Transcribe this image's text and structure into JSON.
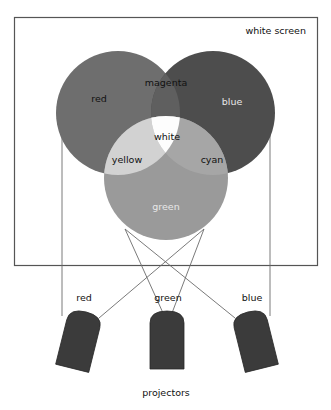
{
  "figure": {
    "title_label": "white screen",
    "footer_label": "projectors",
    "screen": {
      "label": "white screen",
      "border_color": "#555555"
    },
    "circles": [
      {
        "name": "red",
        "label": "red",
        "color": "#6e6e6e",
        "cx": 118,
        "cy": 113,
        "r": 62
      },
      {
        "name": "blue",
        "label": "blue",
        "color": "#4d4d4d",
        "cx": 213,
        "cy": 113,
        "r": 62
      },
      {
        "name": "green",
        "label": "green",
        "color": "#9a9a9a",
        "cx": 166,
        "cy": 178,
        "r": 62
      }
    ],
    "overlaps": [
      {
        "name": "magenta",
        "label": "magenta",
        "color": "#5f5f5f"
      },
      {
        "name": "yellow",
        "label": "yellow",
        "color": "#d2d2d2"
      },
      {
        "name": "cyan",
        "label": "cyan",
        "color": "#a6a6a6"
      },
      {
        "name": "white",
        "label": "white",
        "color": "#fdfdfd"
      }
    ],
    "region_labels": [
      {
        "key": "red",
        "text": "red",
        "x": 99,
        "y": 99,
        "tone": "dark"
      },
      {
        "key": "magenta",
        "text": "magenta",
        "x": 166,
        "y": 83,
        "tone": "dark"
      },
      {
        "key": "blue",
        "text": "blue",
        "x": 232,
        "y": 102,
        "tone": "light"
      },
      {
        "key": "white",
        "text": "white",
        "x": 167,
        "y": 137,
        "tone": "dark"
      },
      {
        "key": "yellow",
        "text": "yellow",
        "x": 127,
        "y": 160,
        "tone": "dark"
      },
      {
        "key": "cyan",
        "text": "cyan",
        "x": 212,
        "y": 160,
        "tone": "dark"
      },
      {
        "key": "green",
        "text": "green",
        "x": 166,
        "y": 207,
        "tone": "light"
      }
    ],
    "projectors": [
      {
        "name": "red",
        "label": "red",
        "label_x": 84,
        "label_y": 298,
        "color": "#3b3b3b",
        "tilt": 14,
        "x": 61,
        "y": 311
      },
      {
        "name": "green",
        "label": "green",
        "label_x": 168,
        "label_y": 298,
        "color": "#3b3b3b",
        "tilt": 0,
        "x": 150,
        "y": 311
      },
      {
        "name": "blue",
        "label": "blue",
        "label_x": 252,
        "label_y": 298,
        "color": "#3b3b3b",
        "tilt": -14,
        "x": 239,
        "y": 311
      }
    ],
    "colors": {
      "background": "#ffffff",
      "outline": "#4a4a4a",
      "ray": "#6b6b6b",
      "text": "#1a1a1a",
      "text_light": "#e8e8e8"
    }
  }
}
